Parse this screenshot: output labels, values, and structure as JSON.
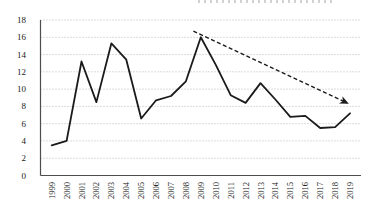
{
  "chart_data": {
    "type": "line",
    "title": "",
    "xlabel": "",
    "ylabel": "",
    "legend": "none",
    "grid": "horizontal-dotted",
    "x": [
      1999,
      2000,
      2001,
      2002,
      2003,
      2004,
      2005,
      2006,
      2007,
      2008,
      2009,
      2010,
      2011,
      2012,
      2013,
      2014,
      2015,
      2016,
      2017,
      2018,
      2019
    ],
    "x_ticks": [
      "1999",
      "2000",
      "2001",
      "2002",
      "2003",
      "2004",
      "2005",
      "2006",
      "2007",
      "2008",
      "2009",
      "2010",
      "2011",
      "2012",
      "2013",
      "2014",
      "2015",
      "2016",
      "2017",
      "2018",
      "2019"
    ],
    "series": [
      {
        "name": "value",
        "values": [
          3.5,
          4.0,
          13.2,
          8.5,
          15.3,
          13.4,
          6.6,
          8.7,
          9.2,
          10.9,
          16.0,
          12.8,
          9.3,
          8.4,
          10.7,
          8.8,
          6.8,
          6.9,
          5.5,
          5.6,
          7.2
        ]
      }
    ],
    "ylim": [
      0,
      18
    ],
    "ytick_step": 2,
    "y_ticks": [
      "0",
      "2",
      "4",
      "6",
      "8",
      "10",
      "12",
      "14",
      "16",
      "18"
    ],
    "line_color": "#1a1a1a",
    "axis_color": "#4d4d4d",
    "grid_color": "#b8b8b8",
    "label_color": "#222222",
    "trend_arrow": {
      "style": "dashed",
      "color": "#1a1a1a",
      "from_x": 2008.5,
      "from_y": 16.7,
      "to_x": 2018.8,
      "to_y": 8.4
    }
  }
}
